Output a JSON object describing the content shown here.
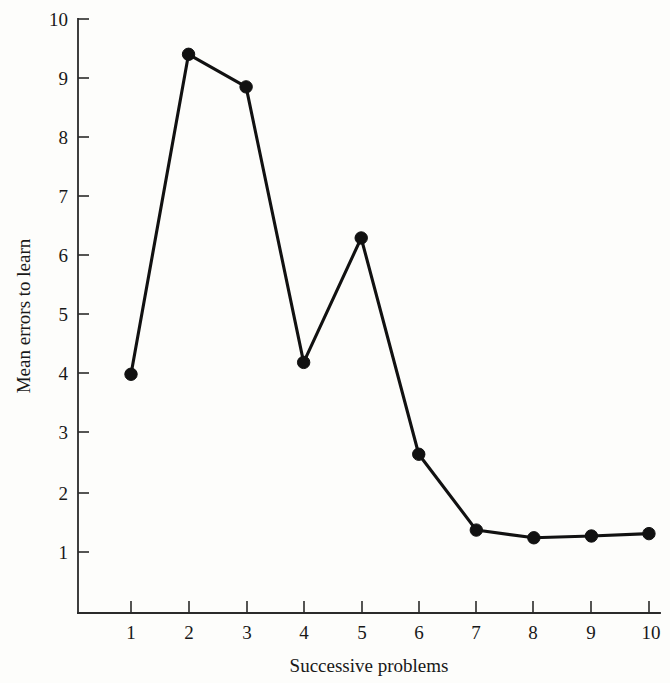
{
  "chart_data": {
    "type": "line",
    "title": "",
    "xlabel": "Successive problems",
    "ylabel": "Mean errors to learn",
    "x": [
      1,
      2,
      3,
      4,
      5,
      6,
      7,
      8,
      9,
      10
    ],
    "categories": [
      "1",
      "2",
      "3",
      "4",
      "5",
      "6",
      "7",
      "8",
      "9",
      "10"
    ],
    "values": [
      4.0,
      9.4,
      8.85,
      4.2,
      6.3,
      2.65,
      1.37,
      1.24,
      1.27,
      1.31
    ],
    "series": [
      {
        "name": "Mean errors to learn",
        "values": [
          4.0,
          9.4,
          8.85,
          4.2,
          6.3,
          2.65,
          1.37,
          1.24,
          1.27,
          1.31
        ]
      }
    ],
    "xlim": [
      0.5,
      10.5
    ],
    "ylim": [
      0.2,
      10.3
    ],
    "xticks": [
      1,
      2,
      3,
      4,
      5,
      6,
      7,
      8,
      9,
      10
    ],
    "yticks": [
      1,
      2,
      3,
      4,
      5,
      6,
      7,
      8,
      9,
      10
    ],
    "xtick_labels": [
      "1",
      "2",
      "3",
      "4",
      "5",
      "6",
      "7",
      "8",
      "9",
      "10"
    ],
    "ytick_labels": [
      "1",
      "2",
      "3",
      "4",
      "5",
      "6",
      "7",
      "8",
      "9",
      "10"
    ],
    "grid": false,
    "legend": false,
    "legend_position": "none",
    "marker": "filled-circle",
    "line_color": "#111111",
    "marker_color": "#111111",
    "axis_color": "#2a2a2a",
    "background_color": "#fdfdfb"
  }
}
